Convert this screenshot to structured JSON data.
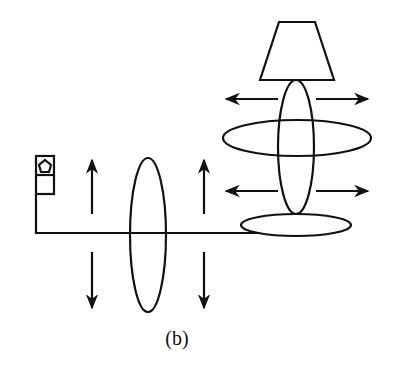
{
  "figure": {
    "caption": "(b)",
    "colors": {
      "stroke": "#111111",
      "background": "#ffffff"
    },
    "elements": [
      {
        "name": "light-source",
        "shape": "box-with-pentagon"
      },
      {
        "name": "fiber-line",
        "shape": "polyline"
      },
      {
        "name": "vertical-polarization-ellipse",
        "shape": "ellipse"
      },
      {
        "name": "vertical-arrows",
        "count": 4
      },
      {
        "name": "fiber-coil",
        "shape": "flat-ellipse"
      },
      {
        "name": "crossed-ellipses",
        "count": 2
      },
      {
        "name": "horizontal-arrows",
        "count": 4
      },
      {
        "name": "detector-trapezoid",
        "shape": "trapezoid"
      }
    ]
  }
}
